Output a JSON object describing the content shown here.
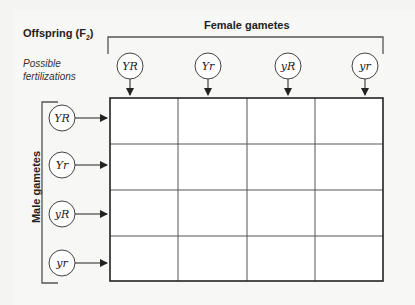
{
  "diagram": {
    "title": "Offspring (F",
    "title_subscript": "2",
    "title_suffix": ")",
    "subtitle_line1": "Possible",
    "subtitle_line2": "fertilizations",
    "female_label": "Female gametes",
    "male_label": "Male gametes",
    "female_gametes": [
      "YR",
      "Yr",
      "yR",
      "yr"
    ],
    "male_gametes": [
      "YR",
      "Yr",
      "yR",
      "yr"
    ],
    "grid": {
      "rows": 4,
      "cols": 4,
      "cells": [
        [
          "",
          "",
          "",
          ""
        ],
        [
          "",
          "",
          "",
          ""
        ],
        [
          "",
          "",
          "",
          ""
        ],
        [
          "",
          "",
          "",
          ""
        ]
      ]
    },
    "colors": {
      "line": "#333333",
      "cell_fill": "#ffffff",
      "background": "#f4f4f3"
    }
  }
}
